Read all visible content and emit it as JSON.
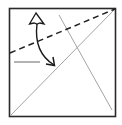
{
  "diagram": {
    "type": "origami-fold-instruction",
    "colors": {
      "background": "#ffffff",
      "paper_edge": "#2a2a2a",
      "crease": "#9a9a9a",
      "fold_line": "#222222",
      "arrow": "#1a1a1a",
      "reference_mark": "#555555"
    },
    "paper": {
      "x": 9,
      "y": 8,
      "width": 107,
      "height": 109
    },
    "creases": [
      {
        "name": "main-diagonal",
        "x1": 10,
        "y1": 116,
        "x2": 115,
        "y2": 9
      },
      {
        "name": "secondary-crease",
        "x1": 59,
        "y1": 15,
        "x2": 112,
        "y2": 110
      }
    ],
    "fold_line": {
      "style": "dashed",
      "x1": 10,
      "y1": 53,
      "x2": 115,
      "y2": 9
    },
    "reference_mark": {
      "x1": 14,
      "y1": 62,
      "x2": 40,
      "y2": 62
    },
    "arrow": {
      "style": "fold-and-unfold",
      "path": "M37,24 C35,40 38,55 54,65",
      "start_head": "open-hollow",
      "end_head": "filled-chevron"
    }
  }
}
